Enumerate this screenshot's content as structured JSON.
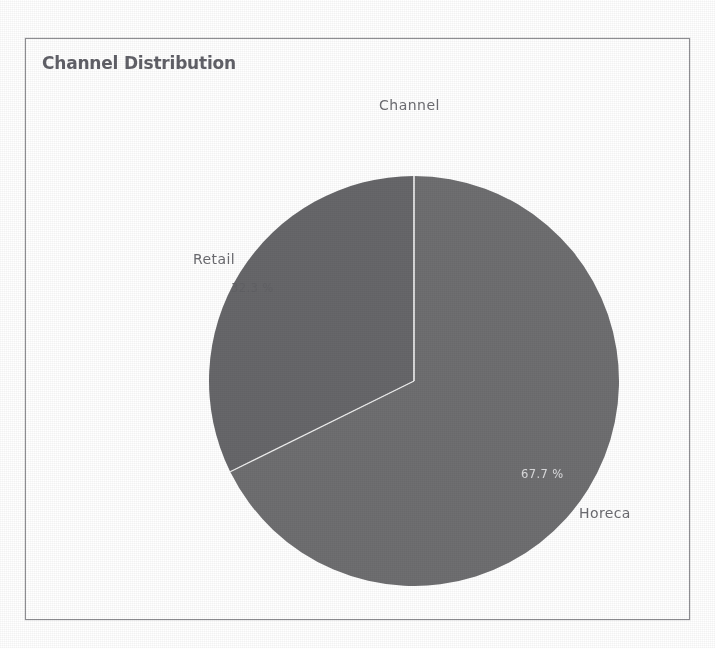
{
  "page": {
    "clipped_header_text": "is between two channels - Horeca and Retail."
  },
  "panel": {
    "title": "Channel Distribution"
  },
  "chart_data": {
    "type": "pie",
    "title": "Channel",
    "categories": [
      "Horeca",
      "Retail"
    ],
    "values": [
      67.7,
      32.3
    ],
    "value_labels": [
      "67.7 %",
      "32.3 %"
    ],
    "unit": "%",
    "start_angle_deg": 0,
    "direction": "clockwise",
    "legend": "none",
    "labels_position": "outside",
    "slices": [
      {
        "name": "Horeca",
        "label": "Horeca",
        "value": 67.7,
        "value_label": "67.7 %",
        "color": "#6f6f71",
        "label_color": "#6b6b70",
        "value_text_color": "#e2e2e4"
      },
      {
        "name": "Retail",
        "label": "Retail",
        "value": 32.3,
        "value_label": "32.3 %",
        "color": "#67676a",
        "label_color": "#6b6b70",
        "value_text_color": "#616165"
      }
    ]
  },
  "style": {
    "panel_border": "#8e8e92",
    "title_color": "#616168",
    "background": "#ffffff",
    "slice_separator": "#f2f2f2"
  }
}
